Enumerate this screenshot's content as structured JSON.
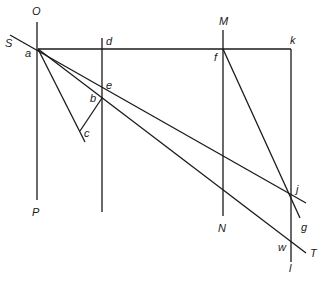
{
  "diagram": {
    "type": "geometric construction",
    "labels": {
      "O": "O",
      "P": "P",
      "S": "S",
      "a": "a",
      "d": "d",
      "e": "e",
      "b": "b",
      "c": "c",
      "M": "M",
      "N": "N",
      "f": "f",
      "k": "k",
      "j": "j",
      "g": "g",
      "w": "w",
      "T": "T",
      "l": "l"
    },
    "points": {
      "a": [
        38,
        49
      ],
      "d": [
        102,
        49
      ],
      "f": [
        223,
        49
      ],
      "k": [
        291,
        49
      ],
      "e": [
        102,
        87
      ],
      "b": [
        102,
        98
      ],
      "c": [
        80,
        131
      ],
      "j": [
        291,
        196
      ],
      "w": [
        291,
        240
      ]
    },
    "lines": [
      {
        "name": "vertical-OP",
        "from": [
          37,
          22
        ],
        "to": [
          37,
          200
        ]
      },
      {
        "name": "vertical-d",
        "from": [
          102,
          38
        ],
        "to": [
          102,
          212
        ]
      },
      {
        "name": "vertical-MN",
        "from": [
          223,
          30
        ],
        "to": [
          223,
          216
        ]
      },
      {
        "name": "vertical-kl",
        "from": [
          291,
          49
        ],
        "to": [
          291,
          262
        ]
      },
      {
        "name": "horizontal-ak",
        "from": [
          38,
          49
        ],
        "to": [
          291,
          49
        ]
      },
      {
        "name": "line-S-through-e-to-j",
        "from": [
          10,
          35
        ],
        "to": [
          306,
          203
        ]
      },
      {
        "name": "line-a-b-w-T",
        "from": [
          38,
          49
        ],
        "to": [
          306,
          253
        ]
      },
      {
        "name": "line-a-c",
        "from": [
          38,
          49
        ],
        "to": [
          85,
          142
        ]
      },
      {
        "name": "line-b-c",
        "from": [
          102,
          98
        ],
        "to": [
          80,
          131
        ]
      },
      {
        "name": "line-f-j-g",
        "from": [
          223,
          49
        ],
        "to": [
          300,
          218
        ]
      }
    ]
  }
}
